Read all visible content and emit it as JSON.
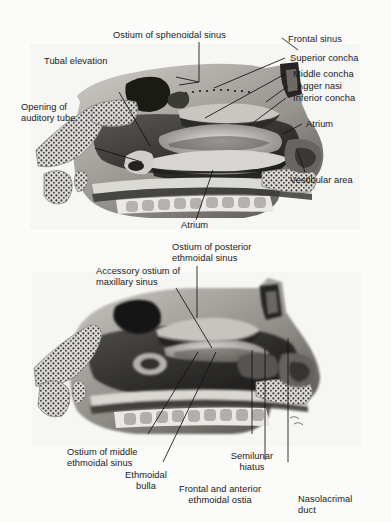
{
  "page": {
    "header_mark": "",
    "background": "#fbfbf9",
    "width": 391,
    "height": 522
  },
  "figures": [
    {
      "id": "upper",
      "name": "lateral-nasal-wall-upper",
      "caption": "Sagittal section of lateral nasal wall showing conchae in place",
      "labels": [
        {
          "key": "ostium_sphenoidal",
          "text": "Ostium of sphenoidal sinus"
        },
        {
          "key": "frontal_sinus",
          "text": "Frontal sinus"
        },
        {
          "key": "superior_concha",
          "text": "Superior concha"
        },
        {
          "key": "middle_concha",
          "text": "Middle concha"
        },
        {
          "key": "agger_nasi",
          "text": "Agger nasi"
        },
        {
          "key": "inferior_concha",
          "text": "Inferior concha"
        },
        {
          "key": "atrium_right",
          "text": "Atrium"
        },
        {
          "key": "vestibular_area",
          "text": "Vestibular area"
        },
        {
          "key": "tubal_elevation",
          "text": "Tubal elevation"
        },
        {
          "key": "opening_auditory_tube",
          "text": "Opening of\nauditory tube"
        },
        {
          "key": "atrium_bottom",
          "text": "Atrium"
        }
      ]
    },
    {
      "id": "lower",
      "name": "lateral-nasal-wall-lower",
      "caption": "Sagittal section of lateral nasal wall with conchae removed showing ostia",
      "labels": [
        {
          "key": "ostium_posterior_ethmoidal",
          "text": "Ostium of posterior\nethmoidal sinus"
        },
        {
          "key": "accessory_ostium_maxillary",
          "text": "Accessory ostium of\nmaxillary sinus"
        },
        {
          "key": "ostium_middle_ethmoidal",
          "text": "Ostium of middle\nethmoidal sinus"
        },
        {
          "key": "ethmoidal_bulla",
          "text": "Ethmoidal\nbulla"
        },
        {
          "key": "semilunar_hiatus",
          "text": "Semilunar\nhiatus"
        },
        {
          "key": "frontal_anterior_ethmoidal_ostia",
          "text": "Frontal and anterior\nethmoidal ostia"
        },
        {
          "key": "nasolacrimal_duct",
          "text": "Nasolacrimal\nduct"
        }
      ]
    }
  ]
}
